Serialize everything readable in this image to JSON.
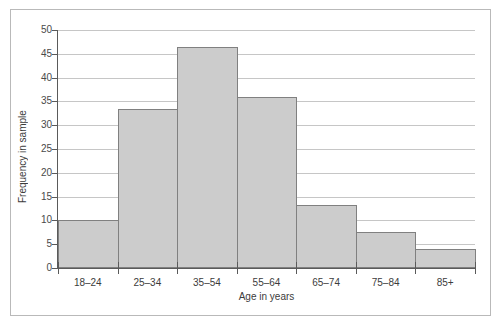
{
  "chart_data": {
    "type": "bar",
    "title": "",
    "subtitle": "",
    "xlabel": "Age in years",
    "ylabel": "Frequency in sample",
    "categories": [
      "18–24",
      "25–34",
      "35–54",
      "55–64",
      "65–74",
      "75–84",
      "85+"
    ],
    "values": [
      10,
      33.5,
      46.5,
      36,
      13.3,
      7.5,
      4
    ],
    "ylim": [
      0,
      50
    ],
    "yticks": [
      0,
      5,
      10,
      15,
      20,
      25,
      30,
      35,
      40,
      45,
      50
    ],
    "ytick_labels": [
      "0",
      "5",
      "10",
      "15",
      "20",
      "25",
      "30",
      "35",
      "40",
      "45",
      "50"
    ],
    "grid": true,
    "grid_axis": "y",
    "legend": false,
    "legend_position": "none",
    "bar_gap": 0,
    "colors": {
      "bar_fill": "#cccccc",
      "bar_edge": "#808080",
      "gridline": "#c6c6c6",
      "axis": "#5a5a5a",
      "text": "#3c3c3c",
      "frame": "#b9b9b9",
      "background": "#ffffff"
    }
  }
}
